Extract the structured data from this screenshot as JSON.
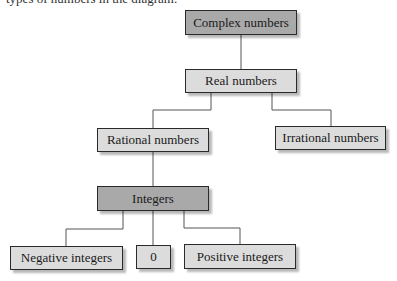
{
  "caption": "types of numbers in the diagram.",
  "nodes": {
    "complex": {
      "label": "Complex numbers",
      "shade": "dark"
    },
    "real": {
      "label": "Real numbers",
      "shade": "light"
    },
    "rational": {
      "label": "Rational numbers",
      "shade": "light"
    },
    "irrational": {
      "label": "Irrational numbers",
      "shade": "light"
    },
    "integers": {
      "label": "Integers",
      "shade": "dark"
    },
    "negative": {
      "label": "Negative integers",
      "shade": "light"
    },
    "zero": {
      "label": "0",
      "shade": "light"
    },
    "positive": {
      "label": "Positive integers",
      "shade": "light"
    }
  },
  "edges": [
    [
      "complex",
      "real"
    ],
    [
      "real",
      "rational"
    ],
    [
      "real",
      "irrational"
    ],
    [
      "rational",
      "integers"
    ],
    [
      "integers",
      "negative"
    ],
    [
      "integers",
      "zero"
    ],
    [
      "integers",
      "positive"
    ]
  ],
  "colors": {
    "dark_fill": "#a9a9a9",
    "light_fill": "#dcdcdc",
    "border": "#2a2a2a",
    "line": "#555555"
  }
}
